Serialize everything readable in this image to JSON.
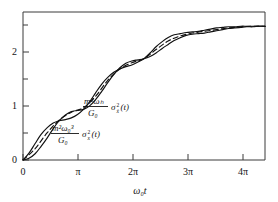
{
  "figure": {
    "background_color": "#ffffff",
    "curve_color": "#111111",
    "axis_color": "#3a3a3a"
  },
  "axes": {
    "x_title": "ω₀t",
    "y_title": "",
    "x_ticks": [
      "0",
      "π",
      "2π",
      "3π",
      "4π"
    ],
    "y_ticks": [
      "0",
      "1",
      "2"
    ]
  },
  "annotations": {
    "upper": {
      "numerator": "m²ωₕ",
      "denominator": "G₀",
      "tail": "σ",
      "tail_sub": "ẋ",
      "tail_sup": "2",
      "tail_arg": "(t)"
    },
    "lower": {
      "numerator": "m²ω₀³",
      "denominator": "G₀",
      "tail": "σ",
      "tail_sub": "x",
      "tail_sup": "2",
      "tail_arg": "(t)"
    }
  },
  "chart_data": {
    "type": "line",
    "title": "",
    "xlabel": "ω₀t",
    "ylabel": "",
    "xlim": [
      0,
      12.566
    ],
    "ylim": [
      0,
      2.6
    ],
    "x_tick_values": [
      0,
      3.1416,
      6.2832,
      9.4248,
      12.5664
    ],
    "x_tick_labels": [
      "0",
      "π",
      "2π",
      "3π",
      "4π"
    ],
    "y_tick_values": [
      0,
      1,
      2
    ],
    "y_tick_labels": [
      "0",
      "1",
      "2"
    ],
    "y_minor_tick_values": [
      0.5,
      1.5,
      2.5
    ],
    "grid": false,
    "legend": "inline-annotations",
    "series": [
      {
        "name": "m²ω₀³/G₀ · σₓ²(t)",
        "annotation_label": "m²ω₀³/G₀ σₓ²(t)",
        "x": [
          0,
          0.31,
          0.63,
          0.94,
          1.26,
          1.57,
          1.88,
          2.2,
          2.51,
          2.83,
          3.14,
          3.46,
          3.77,
          4.08,
          4.4,
          4.71,
          5.03,
          5.34,
          5.65,
          5.97,
          6.28,
          6.6,
          6.91,
          7.23,
          7.54,
          7.85,
          8.17,
          8.48,
          8.8,
          9.11,
          9.42,
          9.74,
          10.05,
          10.37,
          10.68,
          11.0,
          11.31,
          11.62,
          11.94,
          12.25,
          12.57
        ],
        "y": [
          0,
          0.03,
          0.11,
          0.24,
          0.39,
          0.55,
          0.69,
          0.79,
          0.85,
          0.87,
          0.89,
          0.95,
          1.06,
          1.2,
          1.36,
          1.5,
          1.62,
          1.7,
          1.74,
          1.76,
          1.78,
          1.82,
          1.88,
          1.96,
          2.03,
          2.1,
          2.15,
          2.19,
          2.21,
          2.22,
          2.23,
          2.25,
          2.27,
          2.29,
          2.31,
          2.32,
          2.33,
          2.34,
          2.34,
          2.35,
          2.35
        ]
      },
      {
        "name": "m²ωₕ/G₀ · σẋ²(t)",
        "annotation_label": "m²ωₕ/G₀ σẋ²(t)",
        "x": [
          0,
          0.31,
          0.63,
          0.94,
          1.26,
          1.57,
          1.88,
          2.2,
          2.51,
          2.83,
          3.14,
          3.46,
          3.77,
          4.08,
          4.4,
          4.71,
          5.03,
          5.34,
          5.65,
          5.97,
          6.28,
          6.6,
          6.91,
          7.23,
          7.54,
          7.85,
          8.17,
          8.48,
          8.8,
          9.11,
          9.42,
          9.74,
          10.05,
          10.37,
          10.68,
          11.0,
          11.31,
          11.62,
          11.94,
          12.25,
          12.57
        ],
        "y": [
          0,
          0.12,
          0.29,
          0.45,
          0.57,
          0.65,
          0.69,
          0.71,
          0.74,
          0.8,
          0.89,
          1.02,
          1.18,
          1.33,
          1.45,
          1.54,
          1.6,
          1.64,
          1.67,
          1.72,
          1.78,
          1.88,
          1.99,
          2.08,
          2.15,
          2.2,
          2.22,
          2.24,
          2.25,
          2.26,
          2.28,
          2.3,
          2.32,
          2.33,
          2.34,
          2.34,
          2.35,
          2.35,
          2.35,
          2.35,
          2.35
        ]
      },
      {
        "name": "mean-trend",
        "annotation_label": "",
        "style": "dashed",
        "x": [
          0,
          0.63,
          1.26,
          1.88,
          2.51,
          3.14,
          3.77,
          4.4,
          5.03,
          5.65,
          6.28,
          6.91,
          7.54,
          8.17,
          8.8,
          9.42,
          10.05,
          10.68,
          11.31,
          11.94,
          12.57
        ],
        "y": [
          0,
          0.2,
          0.48,
          0.7,
          0.84,
          0.92,
          1.12,
          1.4,
          1.6,
          1.71,
          1.78,
          1.94,
          2.09,
          2.18,
          2.23,
          2.26,
          2.29,
          2.32,
          2.34,
          2.35,
          2.35
        ]
      }
    ]
  }
}
